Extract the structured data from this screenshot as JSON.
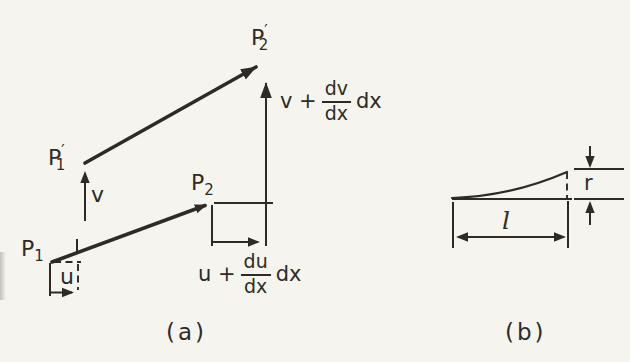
{
  "figure": {
    "background": "#f5f4ef",
    "ink_color": "#2e2b27"
  },
  "panel_a": {
    "caption": "(a)",
    "points": {
      "p1": {
        "base": "P",
        "sub": "1"
      },
      "p1_prime": {
        "base": "P",
        "prime": "′",
        "sub": "1"
      },
      "p2": {
        "base": "P",
        "sub": "2"
      },
      "p2_prime": {
        "base": "P",
        "prime": "′",
        "sub": "2"
      }
    },
    "labels": {
      "u": "u",
      "v": "v",
      "u_expr": {
        "prefix": "u +",
        "num": "du",
        "den": "dx",
        "suffix": "dx"
      },
      "v_expr": {
        "prefix": "v +",
        "num": "dv",
        "den": "dx",
        "suffix": "dx"
      }
    }
  },
  "panel_b": {
    "caption": "(b)",
    "labels": {
      "r": "r",
      "l": "l"
    }
  }
}
